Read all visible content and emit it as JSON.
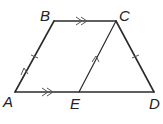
{
  "diagram": {
    "type": "trapezoid-geometry",
    "points": [
      {
        "label": "A",
        "x": 15,
        "y": 92
      },
      {
        "label": "B",
        "x": 54,
        "y": 21
      },
      {
        "label": "C",
        "x": 116,
        "y": 21
      },
      {
        "label": "D",
        "x": 154,
        "y": 92
      },
      {
        "label": "E",
        "x": 79,
        "y": 92
      }
    ],
    "segments": [
      "AB",
      "BC",
      "CD",
      "AD",
      "CE"
    ],
    "markings": {
      "congruent_ticks": [
        "AB",
        "CD"
      ],
      "parallel_single_arrow": [
        "AB",
        "EC"
      ],
      "parallel_double_arrow": [
        "BC",
        "AE"
      ]
    },
    "colors": {
      "line": "#2b2b2b",
      "marks": "#555555"
    }
  },
  "labels": {
    "A": "A",
    "B": "B",
    "C": "C",
    "D": "D",
    "E": "E"
  }
}
